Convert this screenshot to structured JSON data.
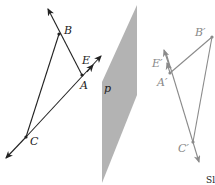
{
  "diagram": {
    "plane_label": "p",
    "left_figure": {
      "points": {
        "A": "A",
        "B": "B",
        "C": "C",
        "E": "E"
      }
    },
    "right_figure": {
      "points": {
        "A": "A′",
        "B": "B′",
        "C": "C′",
        "E": "E′"
      }
    },
    "corner_text": "Sl"
  },
  "colors": {
    "dark_line": "#222222",
    "light_line": "#8a8a8a",
    "plane_fill": "#b3b3b3"
  }
}
